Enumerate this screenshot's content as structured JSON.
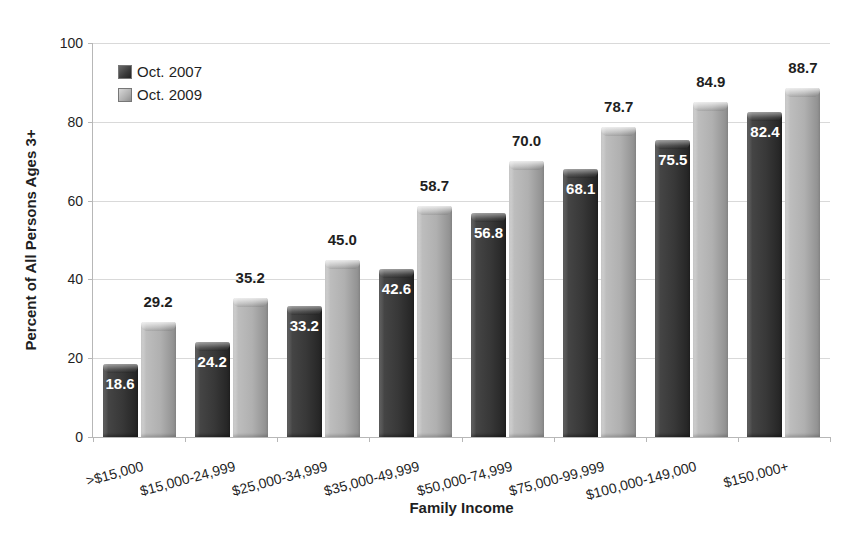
{
  "chart_data": {
    "type": "bar",
    "title": "",
    "xlabel": "Family Income",
    "ylabel": "Percent of All Persons Ages 3+",
    "ylim": [
      0,
      100
    ],
    "yticks": [
      0,
      20,
      40,
      60,
      80,
      100
    ],
    "grid": true,
    "legend_position": "top-left-inside",
    "categories": [
      ">$15,000",
      "$15,000-24,999",
      "$25,000-34,999",
      "$35,000-49,999",
      "$50,000-74,999",
      "$75,000-99,999",
      "$100,000-149,000",
      "$150,000+"
    ],
    "series": [
      {
        "name": "Oct. 2007",
        "color": "#3d3d3d",
        "label_style": "white-inside-top",
        "values": [
          18.6,
          24.2,
          33.2,
          42.6,
          56.8,
          68.1,
          75.5,
          82.4
        ]
      },
      {
        "name": "Oct. 2009",
        "color": "#b2b2b2",
        "label_style": "black-above",
        "values": [
          29.2,
          35.2,
          45.0,
          58.7,
          70.0,
          78.7,
          84.9,
          88.7
        ]
      }
    ]
  }
}
